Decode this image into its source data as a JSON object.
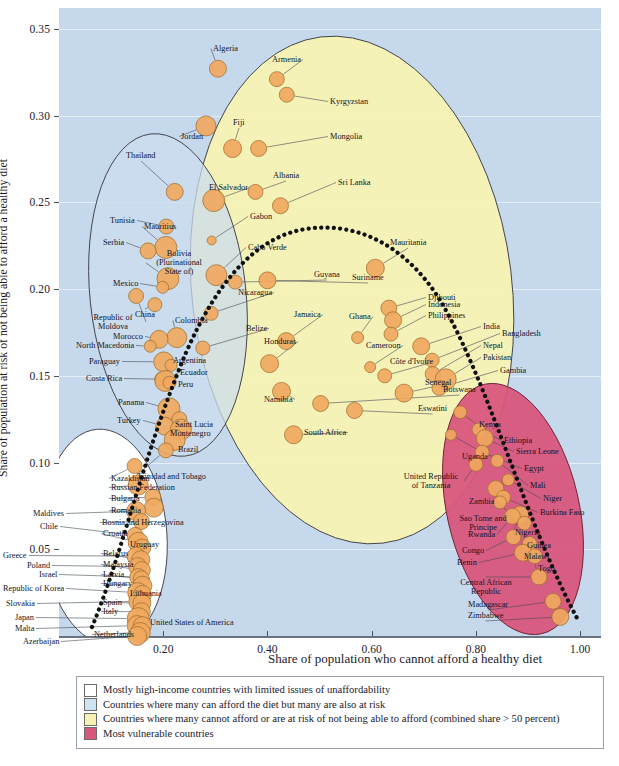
{
  "chart_data": {
    "type": "scatter",
    "title": "",
    "xlabel": "Share of population who cannot afford a healthy diet",
    "ylabel": "Share of population at risk of not being able to afford a healthy diet",
    "xlim": [
      0.0,
      1.04
    ],
    "ylim": [
      0.0,
      0.362
    ],
    "xticks": [
      0.2,
      0.4,
      0.6,
      0.8,
      1.0
    ],
    "xtick_labels": [
      "0.20",
      "0.40",
      "0.60",
      "0.80",
      "1.00"
    ],
    "yticks": [
      0.05,
      0.1,
      0.15,
      0.2,
      0.25,
      0.3,
      0.35
    ],
    "ytick_labels": [
      "0.05",
      "0.10",
      "0.15",
      "0.20",
      "0.25",
      "0.30",
      "0.35"
    ],
    "grid": true,
    "legend_position": "below-plot",
    "note": "Bubble size encodes population; a dotted trend curve runs from lower-left to lower-right through the cloud.",
    "points": [
      {
        "name": "Algeria",
        "x": 0.305,
        "y": 0.327,
        "r": 8.5,
        "group": "yellow"
      },
      {
        "name": "Armenia",
        "x": 0.418,
        "y": 0.321,
        "r": 7.5,
        "group": "yellow"
      },
      {
        "name": "Kyrgyzstan",
        "x": 0.437,
        "y": 0.312,
        "r": 7.5,
        "group": "yellow"
      },
      {
        "name": "Jordan",
        "x": 0.282,
        "y": 0.294,
        "r": 10.0,
        "group": "yellow"
      },
      {
        "name": "Fiji",
        "x": 0.333,
        "y": 0.281,
        "r": 9.0,
        "group": "yellow"
      },
      {
        "name": "Mongolia",
        "x": 0.383,
        "y": 0.281,
        "r": 8.0,
        "group": "yellow"
      },
      {
        "name": "Thailand",
        "x": 0.222,
        "y": 0.256,
        "r": 8.5,
        "group": "blue"
      },
      {
        "name": "El Salvador",
        "x": 0.297,
        "y": 0.251,
        "r": 11.0,
        "group": "yellow"
      },
      {
        "name": "Albania",
        "x": 0.377,
        "y": 0.256,
        "r": 7.5,
        "group": "yellow"
      },
      {
        "name": "Sri Lanka",
        "x": 0.425,
        "y": 0.248,
        "r": 8.0,
        "group": "yellow"
      },
      {
        "name": "Tunisia",
        "x": 0.206,
        "y": 0.236,
        "r": 7.5,
        "group": "blue"
      },
      {
        "name": "Mauritius",
        "x": 0.205,
        "y": 0.224,
        "r": 11.0,
        "group": "blue"
      },
      {
        "name": "Serbia",
        "x": 0.171,
        "y": 0.222,
        "r": 8.0,
        "group": "blue"
      },
      {
        "name": "Gabon",
        "x": 0.293,
        "y": 0.228,
        "r": 4.5,
        "group": "yellow"
      },
      {
        "name": "Cabo Verde",
        "x": 0.302,
        "y": 0.208,
        "r": 10.5,
        "group": "yellow"
      },
      {
        "name": "Bolivia (Plurinational State of)",
        "x": 0.209,
        "y": 0.206,
        "r": 11.0,
        "group": "blue"
      },
      {
        "name": "Mexico",
        "x": 0.199,
        "y": 0.201,
        "r": 6.0,
        "group": "blue"
      },
      {
        "name": "Guyana",
        "x": 0.338,
        "y": 0.204,
        "r": 7.0,
        "group": "yellow"
      },
      {
        "name": "Mauritania",
        "x": 0.607,
        "y": 0.212,
        "r": 9.0,
        "group": "yellow"
      },
      {
        "name": "Suriname",
        "x": 0.4,
        "y": 0.205,
        "r": 8.5,
        "group": "yellow"
      },
      {
        "name": "Republic of Moldova",
        "x": 0.148,
        "y": 0.196,
        "r": 7.5,
        "group": "blue"
      },
      {
        "name": "China",
        "x": 0.184,
        "y": 0.191,
        "r": 7.0,
        "group": "blue"
      },
      {
        "name": "Nicaragua",
        "x": 0.292,
        "y": 0.186,
        "r": 7.0,
        "group": "yellow"
      },
      {
        "name": "Djibouti",
        "x": 0.633,
        "y": 0.189,
        "r": 8.0,
        "group": "yellow"
      },
      {
        "name": "Indonesia",
        "x": 0.641,
        "y": 0.182,
        "r": 8.5,
        "group": "yellow"
      },
      {
        "name": "Philippines",
        "x": 0.637,
        "y": 0.174,
        "r": 7.0,
        "group": "yellow"
      },
      {
        "name": "Colombia",
        "x": 0.226,
        "y": 0.172,
        "r": 10.0,
        "group": "blue"
      },
      {
        "name": "Morocco",
        "x": 0.192,
        "y": 0.171,
        "r": 9.0,
        "group": "blue"
      },
      {
        "name": "North Macedonia",
        "x": 0.175,
        "y": 0.167,
        "r": 6.0,
        "group": "blue"
      },
      {
        "name": "Belize",
        "x": 0.276,
        "y": 0.166,
        "r": 7.0,
        "group": "yellow"
      },
      {
        "name": "Jamaica",
        "x": 0.436,
        "y": 0.17,
        "r": 8.5,
        "group": "yellow"
      },
      {
        "name": "Ghana",
        "x": 0.573,
        "y": 0.172,
        "r": 6.0,
        "group": "yellow"
      },
      {
        "name": "India",
        "x": 0.695,
        "y": 0.167,
        "r": 8.5,
        "group": "yellow"
      },
      {
        "name": "Bangladesh",
        "x": 0.716,
        "y": 0.159,
        "r": 7.0,
        "group": "yellow"
      },
      {
        "name": "Paraguay",
        "x": 0.201,
        "y": 0.158,
        "r": 10.0,
        "group": "blue"
      },
      {
        "name": "Argentina",
        "x": 0.215,
        "y": 0.156,
        "r": 6.0,
        "group": "blue"
      },
      {
        "name": "Honduras",
        "x": 0.404,
        "y": 0.157,
        "r": 9.0,
        "group": "yellow"
      },
      {
        "name": "Cameroon",
        "x": 0.597,
        "y": 0.155,
        "r": 5.5,
        "group": "yellow"
      },
      {
        "name": "Nepal",
        "x": 0.717,
        "y": 0.151,
        "r": 7.5,
        "group": "yellow"
      },
      {
        "name": "Costa Rica",
        "x": 0.197,
        "y": 0.148,
        "r": 7.0,
        "group": "blue"
      },
      {
        "name": "Ecuador",
        "x": 0.204,
        "y": 0.147,
        "r": 10.5,
        "group": "blue"
      },
      {
        "name": "Peru",
        "x": 0.212,
        "y": 0.146,
        "r": 6.5,
        "group": "blue"
      },
      {
        "name": "Côte d'Ivoire",
        "x": 0.625,
        "y": 0.15,
        "r": 7.0,
        "group": "yellow"
      },
      {
        "name": "Pakistan",
        "x": 0.742,
        "y": 0.148,
        "r": 10.5,
        "group": "yellow"
      },
      {
        "name": "Gambia",
        "x": 0.73,
        "y": 0.143,
        "r": 7.5,
        "group": "yellow"
      },
      {
        "name": "Namibia",
        "x": 0.427,
        "y": 0.141,
        "r": 9.0,
        "group": "yellow"
      },
      {
        "name": "Senegal",
        "x": 0.662,
        "y": 0.14,
        "r": 9.0,
        "group": "yellow"
      },
      {
        "name": "Panama",
        "x": 0.211,
        "y": 0.131,
        "r": 11.0,
        "group": "blue"
      },
      {
        "name": "Botswana",
        "x": 0.502,
        "y": 0.134,
        "r": 8.0,
        "group": "yellow"
      },
      {
        "name": "Eswatini",
        "x": 0.567,
        "y": 0.13,
        "r": 8.0,
        "group": "yellow"
      },
      {
        "name": "Kenya",
        "x": 0.77,
        "y": 0.129,
        "r": 6.5,
        "group": "pink"
      },
      {
        "name": "Turkey",
        "x": 0.203,
        "y": 0.121,
        "r": 9.0,
        "group": "blue"
      },
      {
        "name": "Saint Lucia",
        "x": 0.231,
        "y": 0.125,
        "r": 7.5,
        "group": "blue"
      },
      {
        "name": "Montenegro",
        "x": 0.234,
        "y": 0.119,
        "r": 10.5,
        "group": "blue"
      },
      {
        "name": "Brazil",
        "x": 0.222,
        "y": 0.113,
        "r": 10.5,
        "group": "blue"
      },
      {
        "name": "South Africa",
        "x": 0.45,
        "y": 0.116,
        "r": 9.0,
        "group": "yellow"
      },
      {
        "name": "Uganda",
        "x": 0.752,
        "y": 0.116,
        "r": 5.5,
        "group": "pink"
      },
      {
        "name": "Ethiopia",
        "x": 0.805,
        "y": 0.119,
        "r": 6.5,
        "group": "pink"
      },
      {
        "name": "Sierra Leone",
        "x": 0.817,
        "y": 0.114,
        "r": 8.5,
        "group": "pink"
      },
      {
        "name": "Egypt",
        "x": 0.812,
        "y": 0.106,
        "r": 7.0,
        "group": "pink"
      },
      {
        "name": "Trinidad and Tobago",
        "x": 0.205,
        "y": 0.107,
        "r": 7.5,
        "group": "white"
      },
      {
        "name": "Kazakhstan",
        "x": 0.145,
        "y": 0.098,
        "r": 7.5,
        "group": "white"
      },
      {
        "name": "United Republic of Tanzania",
        "x": 0.8,
        "y": 0.099,
        "r": 7.0,
        "group": "pink"
      },
      {
        "name": "Mali",
        "x": 0.841,
        "y": 0.101,
        "r": 6.5,
        "group": "pink"
      },
      {
        "name": "Russian Federation",
        "x": 0.152,
        "y": 0.087,
        "r": 10.0,
        "group": "white"
      },
      {
        "name": "Niger",
        "x": 0.862,
        "y": 0.09,
        "r": 6.0,
        "group": "pink"
      },
      {
        "name": "Zambia",
        "x": 0.838,
        "y": 0.085,
        "r": 8.0,
        "group": "pink"
      },
      {
        "name": "Bulgaria",
        "x": 0.18,
        "y": 0.08,
        "r": 8.0,
        "group": "white"
      },
      {
        "name": "Burkina Faso",
        "x": 0.853,
        "y": 0.08,
        "r": 7.0,
        "group": "pink"
      },
      {
        "name": "Romania",
        "x": 0.182,
        "y": 0.074,
        "r": 9.5,
        "group": "white"
      },
      {
        "name": "Sao Tome and Principe",
        "x": 0.846,
        "y": 0.077,
        "r": 6.5,
        "group": "pink"
      },
      {
        "name": "Maldives",
        "x": 0.148,
        "y": 0.072,
        "r": 9.5,
        "group": "white"
      },
      {
        "name": "Bosnia and Herzegovina",
        "x": 0.158,
        "y": 0.066,
        "r": 8.0,
        "group": "white"
      },
      {
        "name": "Nigeria",
        "x": 0.885,
        "y": 0.07,
        "r": 8.5,
        "group": "pink"
      },
      {
        "name": "Rwanda",
        "x": 0.87,
        "y": 0.069,
        "r": 8.0,
        "group": "pink"
      },
      {
        "name": "Guinea",
        "x": 0.893,
        "y": 0.065,
        "r": 7.0,
        "group": "pink"
      },
      {
        "name": "Chile",
        "x": 0.146,
        "y": 0.058,
        "r": 8.0,
        "group": "white"
      },
      {
        "name": "Croatia",
        "x": 0.152,
        "y": 0.054,
        "r": 10.0,
        "group": "white"
      },
      {
        "name": "Congo",
        "x": 0.872,
        "y": 0.057,
        "r": 7.5,
        "group": "pink"
      },
      {
        "name": "Uruguay",
        "x": 0.16,
        "y": 0.051,
        "r": 8.5,
        "group": "white"
      },
      {
        "name": "Malawi",
        "x": 0.903,
        "y": 0.053,
        "r": 7.5,
        "group": "pink"
      },
      {
        "name": "Benin",
        "x": 0.89,
        "y": 0.048,
        "r": 8.5,
        "group": "pink"
      },
      {
        "name": "Greece",
        "x": 0.148,
        "y": 0.046,
        "r": 9.0,
        "group": "white"
      },
      {
        "name": "Belarus",
        "x": 0.157,
        "y": 0.044,
        "r": 9.0,
        "group": "white"
      },
      {
        "name": "Togo",
        "x": 0.913,
        "y": 0.046,
        "r": 7.5,
        "group": "pink"
      },
      {
        "name": "Poland",
        "x": 0.151,
        "y": 0.04,
        "r": 9.0,
        "group": "white"
      },
      {
        "name": "Malaysia",
        "x": 0.159,
        "y": 0.038,
        "r": 8.5,
        "group": "white"
      },
      {
        "name": "Israel",
        "x": 0.152,
        "y": 0.034,
        "r": 8.5,
        "group": "white"
      },
      {
        "name": "Latvia",
        "x": 0.158,
        "y": 0.033,
        "r": 8.0,
        "group": "white"
      },
      {
        "name": "Hungary",
        "x": 0.16,
        "y": 0.029,
        "r": 9.5,
        "group": "white"
      },
      {
        "name": "Central African Republic",
        "x": 0.921,
        "y": 0.034,
        "r": 8.0,
        "group": "pink"
      },
      {
        "name": "Republic of Korea",
        "x": 0.151,
        "y": 0.025,
        "r": 10.0,
        "group": "white"
      },
      {
        "name": "Lithuania",
        "x": 0.16,
        "y": 0.024,
        "r": 9.0,
        "group": "white"
      },
      {
        "name": "Slovakia",
        "x": 0.153,
        "y": 0.02,
        "r": 10.0,
        "group": "white"
      },
      {
        "name": "Spain",
        "x": 0.159,
        "y": 0.019,
        "r": 9.0,
        "group": "white"
      },
      {
        "name": "Madagascar",
        "x": 0.948,
        "y": 0.02,
        "r": 8.0,
        "group": "pink"
      },
      {
        "name": "Italy",
        "x": 0.158,
        "y": 0.014,
        "r": 9.0,
        "group": "white"
      },
      {
        "name": "Japan",
        "x": 0.152,
        "y": 0.01,
        "r": 11.0,
        "group": "white"
      },
      {
        "name": "Zimbabwe",
        "x": 0.962,
        "y": 0.011,
        "r": 8.5,
        "group": "pink"
      },
      {
        "name": "Malta",
        "x": 0.15,
        "y": 0.006,
        "r": 10.0,
        "group": "white"
      },
      {
        "name": "United States of America",
        "x": 0.16,
        "y": 0.006,
        "r": 9.0,
        "group": "white"
      },
      {
        "name": "Netherlands",
        "x": 0.156,
        "y": 0.002,
        "r": 10.0,
        "group": "white"
      },
      {
        "name": "Azerbaijan",
        "x": 0.15,
        "y": 0.0,
        "r": 9.5,
        "group": "white"
      }
    ],
    "clusters": [
      {
        "name": "white-cluster",
        "label_key": "high_income",
        "color": "#ffffff"
      },
      {
        "name": "blue-cluster",
        "label_key": "can_afford_at_risk",
        "color": "#c6d9ec"
      },
      {
        "name": "yellow-cluster",
        "label_key": "cannot_afford",
        "color": "#f7f2b4"
      },
      {
        "name": "pink-cluster",
        "label_key": "most_vulnerable",
        "color": "#d9567d"
      }
    ]
  },
  "legend": {
    "items": [
      {
        "swatch": "#ffffff",
        "text": "Mostly high-income countries with limited issues of unaffordability"
      },
      {
        "swatch": "#cfe4f2",
        "text": "Countries where many can afford the diet but many are also at risk"
      },
      {
        "swatch": "#f7f2b4",
        "text": "Countries where many cannot afford or are at risk of not being able to afford (combined share > 50 percent)"
      },
      {
        "swatch": "#d9567d",
        "text": "Most vulnerable countries"
      }
    ]
  },
  "colors": {
    "plot_background": "#c6d9ec",
    "yellow_region": "#f7f2b4",
    "pink_region": "#d9567d",
    "white_region": "#ffffff",
    "bubble_fill": "#f0a860",
    "bubble_stroke": "#9a6a2a",
    "trend_line": "#111111",
    "text": "#13131f"
  },
  "footer": {
    "note": ""
  }
}
